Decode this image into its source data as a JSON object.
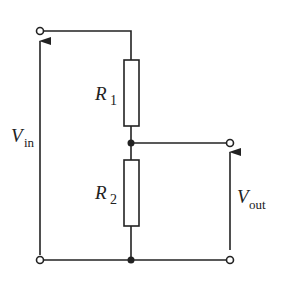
{
  "diagram": {
    "type": "voltage-divider-circuit",
    "labels": {
      "r1_main": "R",
      "r1_sub": "1",
      "r2_main": "R",
      "r2_sub": "2",
      "vin_main": "V",
      "vin_sub": "in",
      "vout_main": "V",
      "vout_sub": "out"
    },
    "colors": {
      "line": "#222222",
      "background": "#ffffff"
    }
  }
}
